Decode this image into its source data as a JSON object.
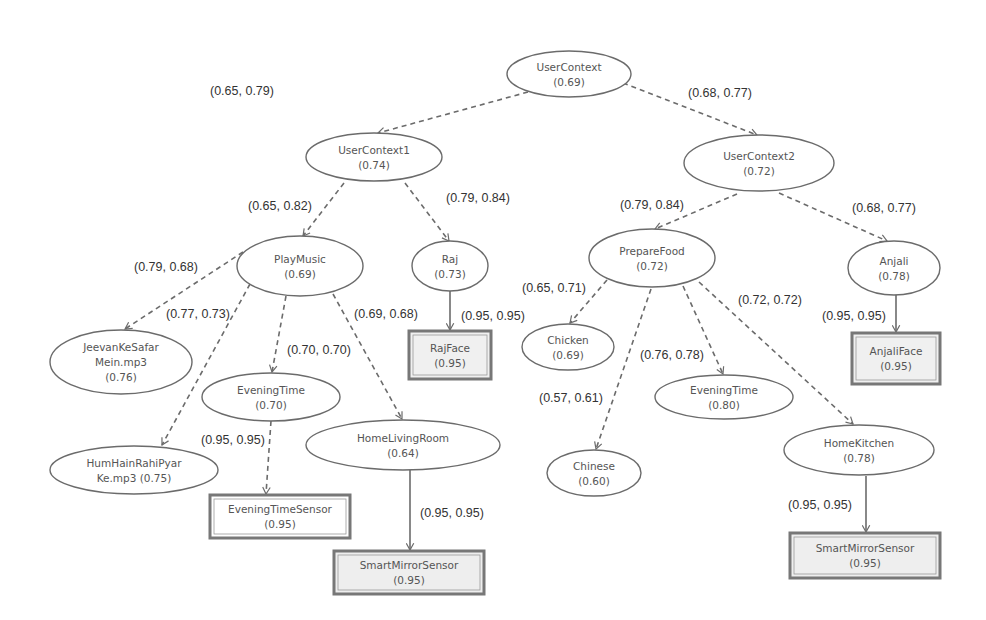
{
  "diagram": {
    "type": "context-tree",
    "nodes": [
      {
        "id": "usercontext",
        "name": "UserContext",
        "score": "(0.69)",
        "shape": "ellipse",
        "cx": 569,
        "cy": 74,
        "rx": 62,
        "ry": 23
      },
      {
        "id": "usercontext1",
        "name": "UserContext1",
        "score": "(0.74)",
        "shape": "ellipse",
        "cx": 374,
        "cy": 157,
        "rx": 68,
        "ry": 24
      },
      {
        "id": "usercontext2",
        "name": "UserContext2",
        "score": "(0.72)",
        "shape": "ellipse",
        "cx": 759,
        "cy": 163,
        "rx": 75,
        "ry": 28
      },
      {
        "id": "playmusic",
        "name": "PlayMusic",
        "score": "(0.69)",
        "shape": "ellipse",
        "cx": 300,
        "cy": 266,
        "rx": 63,
        "ry": 30
      },
      {
        "id": "raj",
        "name": "Raj",
        "score": "(0.73)",
        "shape": "ellipse",
        "cx": 450,
        "cy": 266,
        "rx": 38,
        "ry": 25
      },
      {
        "id": "rajface",
        "name": "RajFace",
        "score": "(0.95)",
        "shape": "box",
        "x": 409,
        "y": 331,
        "w": 82,
        "h": 48,
        "fill": "#f0f0f0"
      },
      {
        "id": "preparefood",
        "name": "PrepareFood",
        "score": "(0.72)",
        "shape": "ellipse",
        "cx": 652,
        "cy": 258,
        "rx": 63,
        "ry": 29
      },
      {
        "id": "anjali",
        "name": "Anjali",
        "score": "(0.78)",
        "shape": "ellipse",
        "cx": 894,
        "cy": 268,
        "rx": 46,
        "ry": 27
      },
      {
        "id": "anjaliface",
        "name": "AnjaliFace",
        "score": "(0.95)",
        "shape": "box",
        "x": 852,
        "y": 333,
        "w": 88,
        "h": 51,
        "fill": "#f0f0f0"
      },
      {
        "id": "chicken",
        "name": "Chicken",
        "score": "(0.69)",
        "shape": "ellipse",
        "cx": 568,
        "cy": 347,
        "rx": 46,
        "ry": 23
      },
      {
        "id": "eveningtime2",
        "name": "EveningTime",
        "score": "(0.80)",
        "shape": "ellipse",
        "cx": 724,
        "cy": 397,
        "rx": 69,
        "ry": 22
      },
      {
        "id": "chinese",
        "name": "Chinese",
        "score": "(0.60)",
        "shape": "ellipse",
        "cx": 594,
        "cy": 473,
        "rx": 47,
        "ry": 23
      },
      {
        "id": "homekitchen",
        "name": "HomeKitchen",
        "score": "(0.78)",
        "shape": "ellipse",
        "cx": 859,
        "cy": 450,
        "rx": 75,
        "ry": 25
      },
      {
        "id": "smartmirror2",
        "name": "SmartMirrorSensor",
        "score": "(0.95)",
        "shape": "box",
        "x": 790,
        "y": 533,
        "w": 150,
        "h": 45,
        "fill": "#eeeeee"
      },
      {
        "id": "jeevan",
        "name": "JeevanKeSafar",
        "name2": "Mein.mp3",
        "score": "(0.76)",
        "shape": "ellipse",
        "cx": 121,
        "cy": 362,
        "rx": 71,
        "ry": 32
      },
      {
        "id": "eveningtime1",
        "name": "EveningTime",
        "score": "(0.70)",
        "shape": "ellipse",
        "cx": 271,
        "cy": 397,
        "rx": 69,
        "ry": 24
      },
      {
        "id": "humhain",
        "name": "HumHainRahiPyar",
        "name2": "Ke.mp3 (0.75)",
        "score": "",
        "shape": "ellipse",
        "cx": 134,
        "cy": 470,
        "rx": 84,
        "ry": 24
      },
      {
        "id": "homelivingroom",
        "name": "HomeLivingRoom",
        "score": "(0.64)",
        "shape": "ellipse",
        "cx": 403,
        "cy": 445,
        "rx": 97,
        "ry": 25
      },
      {
        "id": "eveningtimesensor",
        "name": "EveningTimeSensor",
        "score": "(0.95)",
        "shape": "box",
        "x": 210,
        "y": 495,
        "w": 140,
        "h": 43,
        "fill": "#ffffff"
      },
      {
        "id": "smartmirror1",
        "name": "SmartMirrorSensor",
        "score": "(0.95)",
        "shape": "box",
        "x": 334,
        "y": 551,
        "w": 150,
        "h": 43,
        "fill": "#eeeeee"
      }
    ],
    "edges": [
      {
        "from": "usercontext",
        "to": "usercontext1",
        "label": "(0.65, 0.79)",
        "style": "dashed",
        "x1": 528,
        "y1": 92,
        "x2": 378,
        "y2": 133,
        "lx": 210,
        "ly": 95
      },
      {
        "from": "usercontext",
        "to": "usercontext2",
        "label": "(0.68, 0.77)",
        "style": "dashed",
        "x1": 623,
        "y1": 83,
        "x2": 757,
        "y2": 135,
        "lx": 688,
        "ly": 97
      },
      {
        "from": "usercontext1",
        "to": "playmusic",
        "label": "(0.65, 0.82)",
        "style": "dashed",
        "x1": 344,
        "y1": 183,
        "x2": 303,
        "y2": 236,
        "lx": 248,
        "ly": 210
      },
      {
        "from": "usercontext1",
        "to": "raj",
        "label": "(0.79, 0.84)",
        "style": "dashed",
        "x1": 405,
        "y1": 183,
        "x2": 449,
        "y2": 241,
        "lx": 446,
        "ly": 202
      },
      {
        "from": "raj",
        "to": "rajface",
        "label": "(0.95, 0.95)",
        "style": "solid",
        "x1": 450,
        "y1": 291,
        "x2": 450,
        "y2": 330,
        "lx": 461,
        "ly": 320
      },
      {
        "from": "usercontext2",
        "to": "preparefood",
        "label": "(0.79, 0.84)",
        "style": "dashed",
        "x1": 737,
        "y1": 194,
        "x2": 655,
        "y2": 229,
        "lx": 620,
        "ly": 209
      },
      {
        "from": "usercontext2",
        "to": "anjali",
        "label": "(0.68, 0.77)",
        "style": "dashed",
        "x1": 779,
        "y1": 193,
        "x2": 887,
        "y2": 241,
        "lx": 852,
        "ly": 212
      },
      {
        "from": "anjali",
        "to": "anjaliface",
        "label": "(0.95, 0.95)",
        "style": "solid",
        "x1": 896,
        "y1": 295,
        "x2": 896,
        "y2": 332,
        "lx": 822,
        "ly": 320
      },
      {
        "from": "preparefood",
        "to": "chicken",
        "label": "(0.65, 0.71)",
        "style": "dashed",
        "x1": 607,
        "y1": 280,
        "x2": 570,
        "y2": 323,
        "lx": 522,
        "ly": 292
      },
      {
        "from": "preparefood",
        "to": "chinese",
        "label": "(0.57, 0.61)",
        "style": "dashed",
        "x1": 651,
        "y1": 289,
        "x2": 596,
        "y2": 449,
        "lx": 539,
        "ly": 402
      },
      {
        "from": "preparefood",
        "to": "eveningtime2",
        "label": "(0.76, 0.78)",
        "style": "dashed",
        "x1": 683,
        "y1": 286,
        "x2": 723,
        "y2": 374,
        "lx": 640,
        "ly": 359
      },
      {
        "from": "preparefood",
        "to": "homekitchen",
        "label": "(0.72, 0.72)",
        "style": "dashed",
        "x1": 699,
        "y1": 282,
        "x2": 853,
        "y2": 424,
        "lx": 738,
        "ly": 304
      },
      {
        "from": "homekitchen",
        "to": "smartmirror2",
        "label": "(0.95, 0.95)",
        "style": "solid",
        "x1": 866,
        "y1": 476,
        "x2": 866,
        "y2": 532,
        "lx": 788,
        "ly": 509
      },
      {
        "from": "playmusic",
        "to": "jeevan",
        "label": "(0.79, 0.68)",
        "style": "dashed",
        "x1": 243,
        "y1": 252,
        "x2": 125,
        "y2": 329,
        "lx": 134,
        "ly": 271
      },
      {
        "from": "playmusic",
        "to": "humhain",
        "label": "(0.77, 0.73)",
        "style": "dashed",
        "x1": 250,
        "y1": 284,
        "x2": 162,
        "y2": 445,
        "lx": 166,
        "ly": 318
      },
      {
        "from": "playmusic",
        "to": "eveningtime1",
        "label": "(0.70, 0.70)",
        "style": "dashed",
        "x1": 286,
        "y1": 296,
        "x2": 272,
        "y2": 372,
        "lx": 287,
        "ly": 354
      },
      {
        "from": "playmusic",
        "to": "homelivingroom",
        "label": "(0.69, 0.68)",
        "style": "dashed",
        "x1": 333,
        "y1": 294,
        "x2": 402,
        "y2": 419,
        "lx": 354,
        "ly": 318
      },
      {
        "from": "eveningtime1",
        "to": "eveningtimesensor",
        "label": "(0.95, 0.95)",
        "style": "dashed",
        "x1": 271,
        "y1": 421,
        "x2": 266,
        "y2": 494,
        "lx": 201,
        "ly": 444
      },
      {
        "from": "homelivingroom",
        "to": "smartmirror1",
        "label": "(0.95, 0.95)",
        "style": "solid",
        "x1": 410,
        "y1": 470,
        "x2": 410,
        "y2": 550,
        "lx": 420,
        "ly": 517
      }
    ]
  },
  "colors": {
    "stroke": "#6b6b6b",
    "text": "#555555",
    "edge_text": "#333333",
    "background": "#ffffff"
  }
}
